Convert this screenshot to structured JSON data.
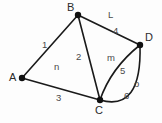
{
  "diagram": {
    "background_color": "#fdfdfd",
    "stroke_color": "#1a1a1a",
    "text_color": "#4a4a4a",
    "vertices": [
      {
        "id": "A",
        "label": "A",
        "x": 22,
        "y": 78
      },
      {
        "id": "B",
        "label": "B",
        "x": 78,
        "y": 15
      },
      {
        "id": "C",
        "label": "C",
        "x": 100,
        "y": 100
      },
      {
        "id": "D",
        "label": "D",
        "x": 140,
        "y": 45
      }
    ],
    "edges": [
      {
        "id": "e1",
        "label": "1",
        "from": "A",
        "to": "B",
        "shape": "straight"
      },
      {
        "id": "e2",
        "label": "2",
        "from": "B",
        "to": "C",
        "shape": "straight"
      },
      {
        "id": "e3",
        "label": "3",
        "from": "A",
        "to": "C",
        "shape": "straight"
      },
      {
        "id": "e4",
        "label": "4",
        "from": "B",
        "to": "D",
        "shape": "straight"
      },
      {
        "id": "e5",
        "label": "5",
        "from": "C",
        "to": "D",
        "shape": "curve-inner"
      },
      {
        "id": "e6",
        "label": "6",
        "from": "C",
        "to": "D",
        "shape": "curve-outer"
      }
    ],
    "faces": [
      {
        "id": "f-n",
        "label": "n"
      },
      {
        "id": "f-m",
        "label": "m"
      },
      {
        "id": "f-o",
        "label": "o"
      },
      {
        "id": "f-L",
        "label": "L"
      }
    ],
    "labels": {
      "vertex_A": "A",
      "vertex_B": "B",
      "vertex_C": "C",
      "vertex_D": "D",
      "edge_1": "1",
      "edge_2": "2",
      "edge_3": "3",
      "edge_4": "4",
      "edge_5": "5",
      "edge_6": "6",
      "face_n": "n",
      "face_m": "m",
      "face_o": "o",
      "face_L": "L"
    }
  }
}
